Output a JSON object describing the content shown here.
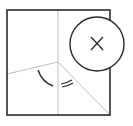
{
  "diagram": {
    "type": "folded-paper-geometry",
    "colors": {
      "outline": "#2b2b2b",
      "fold_line": "#bdbdbd",
      "arc": "#2b2b2b",
      "background": "#ffffff"
    },
    "square": {
      "x": 7,
      "y": 10,
      "width": 103,
      "height": 105
    },
    "center_point": {
      "x": 58,
      "y": 62
    },
    "fold_lines": [
      {
        "name": "vertical-fold",
        "x1": 58,
        "y1": 10,
        "x2": 58,
        "y2": 115
      },
      {
        "name": "left-fold",
        "x1": 58,
        "y1": 62,
        "x2": 7,
        "y2": 74
      },
      {
        "name": "diagonal-fold",
        "x1": 58,
        "y1": 62,
        "x2": 110,
        "y2": 115
      }
    ],
    "circle_marker": {
      "cx": 97,
      "cy": 44,
      "r": 27,
      "symbol": "×",
      "icon": "x-mark-icon"
    },
    "angle_marks": {
      "single_arc": {
        "label": "angle-single-arc"
      },
      "double_arc": {
        "label": "angle-double-arc"
      }
    }
  }
}
